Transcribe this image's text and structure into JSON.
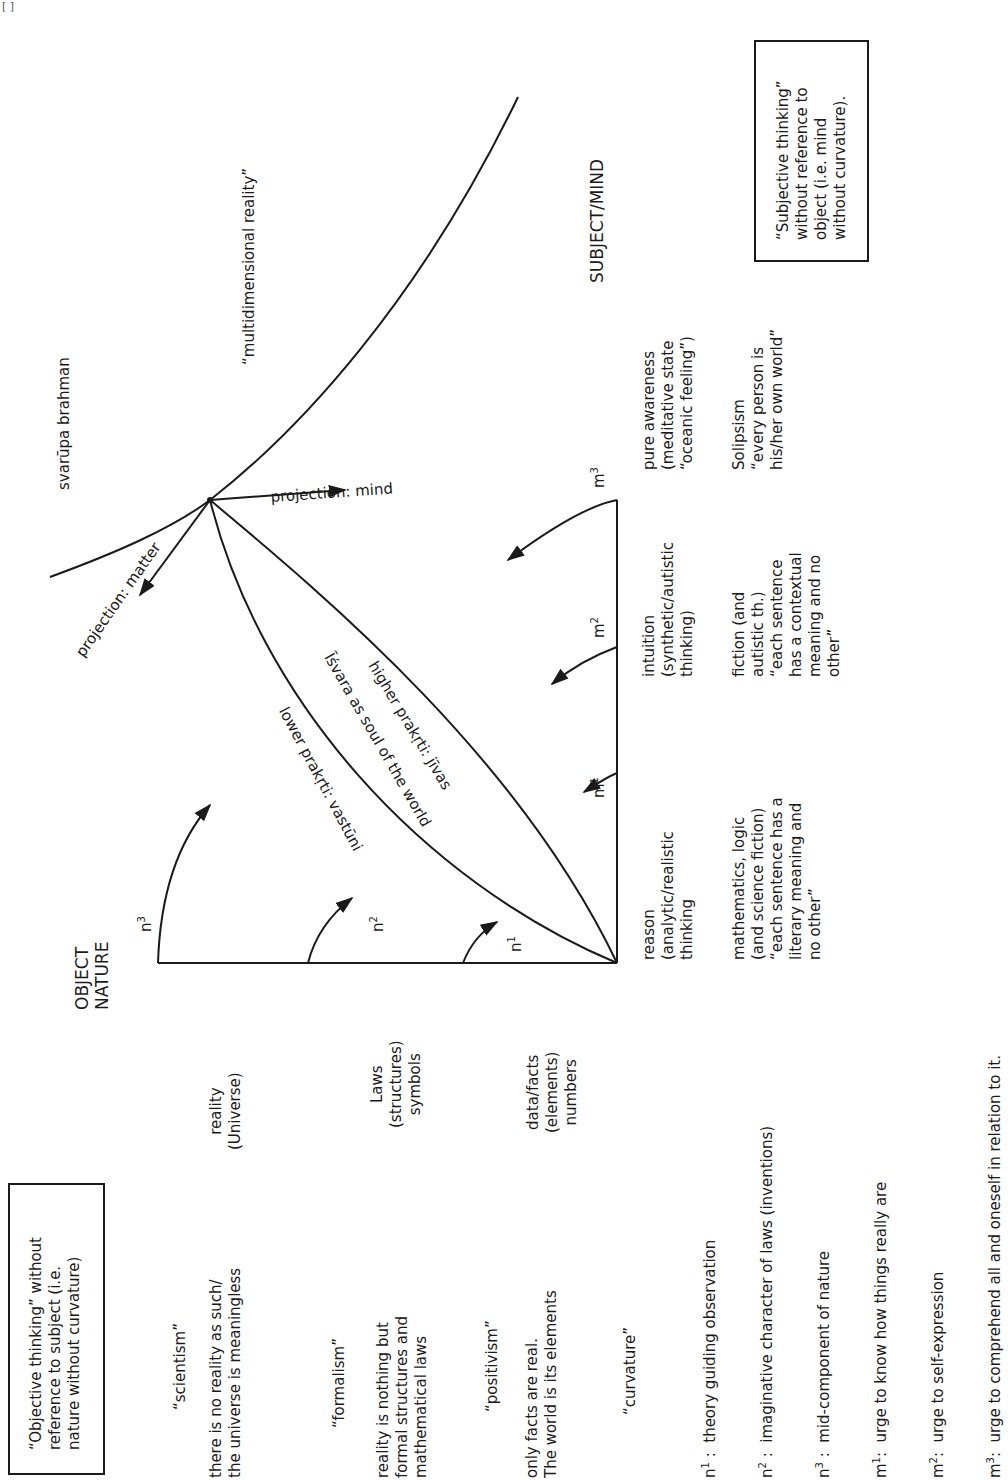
{
  "page": {
    "corner_mark": "[ ]",
    "orientation": "rotated 90° counter-clockwise"
  },
  "top_region": {
    "svarupa": "svarūpa brahman",
    "multidimensional": "“multidimensional reality”",
    "projection_mind": "projection: mind",
    "projection_matter": "projection: matter"
  },
  "axes": {
    "object_nature": "OBJECT\nNATURE",
    "subject_mind": "SUBJECT/MIND"
  },
  "curves": {
    "lower": "lower prakṛti: vastūni",
    "middle": "Īśvara as soul of the world",
    "higher": "higher prakṛti: jīvas"
  },
  "arc_labels": {
    "n1": "n",
    "n1_sup": "1",
    "n2": "n",
    "n2_sup": "2",
    "n3": "n",
    "n3_sup": "3",
    "m1": "m",
    "m1_sup": "1",
    "m2": "m",
    "m2_sup": "2",
    "m3": "m",
    "m3_sup": "3"
  },
  "subject_columns": [
    {
      "mode": "reason\n(analytic/realistic\nthinking",
      "form": "mathematics, logic\n(and science fiction)\n“each sentence has a\nliterary meaning and\nno other”"
    },
    {
      "mode": "intuition\n(synthetic/autistic\nthinking)",
      "form": "fiction (and\nautistic th.)\n“each sentence\nhas a contextual\nmeaning and no\nother”"
    },
    {
      "mode": "pure awareness\n(meditative state\n“oceanic feeling”)",
      "form": "Solipsism\n“every person is\nhis/her own world”"
    }
  ],
  "object_columns": [
    {
      "level": "reality\n(Universe)",
      "ism": "“scientism”",
      "claim": "there is no reality as such/\nthe universe is meaningless"
    },
    {
      "level": "Laws\n(structures)\nsymbols",
      "ism": "“formalism”",
      "claim": "reality is nothing but\nformal structures and\nmathematical laws"
    },
    {
      "level": "data/facts\n(elements)\nnumbers",
      "ism": "“positivism”",
      "claim": "only facts are real.\nThe world is its elements"
    }
  ],
  "curvature": {
    "title": "“curvature”",
    "items": [
      {
        "key": "n",
        "sup": "1",
        "sep": " :  ",
        "text": "theory guiding observation"
      },
      {
        "key": "n",
        "sup": "2",
        "sep": " :  ",
        "text": "imaginative character of laws (inventions)"
      },
      {
        "key": "n",
        "sup": "3",
        "sep": " :  ",
        "text": "mid-component of nature"
      },
      {
        "key": "m",
        "sup": "1",
        "sep": ":  ",
        "text": "urge to know how things really are"
      },
      {
        "key": "m",
        "sup": "2",
        "sep": ":  ",
        "text": "urge to self-expression"
      },
      {
        "key": "m",
        "sup": "3",
        "sep": ":  ",
        "text": "urge to comprehend all and oneself in relation to it."
      }
    ]
  },
  "boxes": {
    "objective": "“Objective thinking” without\nreference to subject (i.e.\nnature without curvature)",
    "subjective": "“Subjective thinking”\nwithout reference to\nobject (i.e. mind\nwithout curvature)."
  },
  "colors": {
    "ink": "#1a1a1a",
    "paper": "#ffffff"
  }
}
